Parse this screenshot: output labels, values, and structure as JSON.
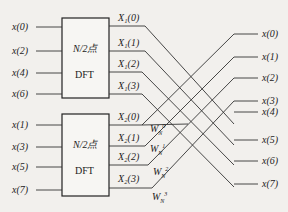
{
  "diagram": {
    "type": "fft-butterfly-decimation-in-time",
    "inputs_even": [
      "x(0)",
      "x(2)",
      "x(4)",
      "x(6)"
    ],
    "inputs_odd": [
      "x(1)",
      "x(3)",
      "x(5)",
      "x(7)"
    ],
    "block_top": {
      "line1": "N/2点",
      "line2": "DFT"
    },
    "block_bottom": {
      "line1": "N/2点",
      "line2": "DFT"
    },
    "block_outputs_top": [
      "X₁(0)",
      "X₁(1)",
      "X₁(2)",
      "X₁(3)"
    ],
    "block_outputs_bottom": [
      "X₂(0)",
      "X₂(1)",
      "X₂(2)",
      "X₂(3)"
    ],
    "twiddles": [
      "W",
      "W",
      "W",
      "W"
    ],
    "twiddle_sub": "N",
    "twiddle_sup": [
      "0",
      "1",
      "2",
      "3"
    ],
    "outputs": [
      "x(0)",
      "x(1)",
      "x(2)",
      "x(3)",
      "x(4)",
      "x(5)",
      "x(6)",
      "x(7)"
    ]
  }
}
